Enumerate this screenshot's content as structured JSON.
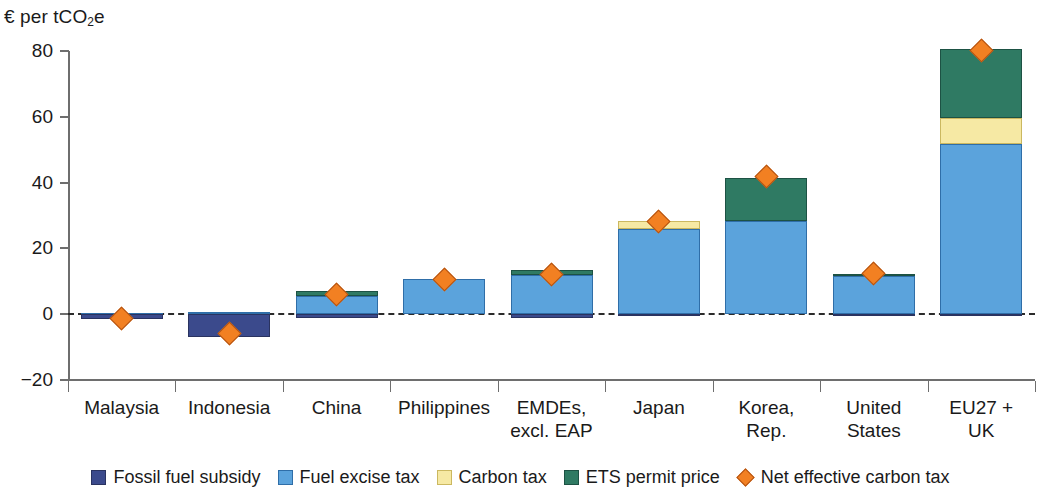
{
  "chart_data": {
    "type": "bar",
    "title": "",
    "subtitle": "",
    "xlabel": "",
    "ylabel": "€ per tCO2e",
    "ylabel_rich": {
      "prefix": "€ per tCO",
      "sub": "2",
      "suffix": "e"
    },
    "ylim": [
      -20,
      80
    ],
    "yticks": [
      -20,
      0,
      20,
      40,
      60,
      80
    ],
    "ytick_labels": [
      "−20",
      "0",
      "20",
      "40",
      "60",
      "80"
    ],
    "grid": false,
    "zero_line": true,
    "stacked": true,
    "legend_position": "bottom",
    "categories": [
      "Malaysia",
      "Indonesia",
      "China",
      "Philippines",
      "EMDEs, excl. EAP",
      "Japan",
      "Korea, Rep.",
      "United States",
      "EU27 + UK"
    ],
    "category_label_lines": [
      [
        "Malaysia",
        ""
      ],
      [
        "Indonesia",
        ""
      ],
      [
        "China",
        ""
      ],
      [
        "Philippines",
        ""
      ],
      [
        "EMDEs,",
        "excl. EAP"
      ],
      [
        "Japan",
        ""
      ],
      [
        "Korea,",
        "Rep."
      ],
      [
        "United",
        "States"
      ],
      [
        "EU27 +",
        "UK"
      ]
    ],
    "series": [
      {
        "name": "Fossil fuel subsidy",
        "color": "#3b4a8c",
        "values": [
          -1.5,
          -7.0,
          -1.2,
          0.0,
          -1.3,
          -0.4,
          0.0,
          -0.3,
          -0.5
        ]
      },
      {
        "name": "Fuel excise tax",
        "color": "#5ba3dc",
        "values": [
          0.3,
          0.8,
          5.5,
          10.6,
          12.0,
          26.0,
          28.2,
          11.6,
          51.6
        ]
      },
      {
        "name": "Carbon tax",
        "color": "#f6e9a4",
        "values": [
          0.0,
          0.0,
          0.0,
          0.0,
          0.0,
          2.3,
          0.0,
          0.0,
          8.0
        ]
      },
      {
        "name": "ETS permit price",
        "color": "#2f7a63",
        "values": [
          0.0,
          0.0,
          1.5,
          0.0,
          1.5,
          0.0,
          13.3,
          0.5,
          21.0
        ]
      }
    ],
    "marker_series": {
      "name": "Net effective carbon tax",
      "color": "#f28022",
      "marker": "diamond",
      "values": [
        -1.4,
        -6.0,
        6.0,
        10.6,
        12.2,
        28.2,
        41.8,
        12.4,
        80.2
      ]
    }
  },
  "legend": {
    "items": [
      {
        "label": "Fossil fuel subsidy",
        "swatch": "subsidy"
      },
      {
        "label": "Fuel excise tax",
        "swatch": "excise"
      },
      {
        "label": "Carbon tax",
        "swatch": "carbontax"
      },
      {
        "label": "ETS permit price",
        "swatch": "ets"
      },
      {
        "label": "Net effective carbon tax",
        "swatch": "diamond-sw"
      }
    ]
  },
  "colors": {
    "subsidy": "#3b4a8c",
    "excise": "#5ba3dc",
    "carbon_tax": "#f6e9a4",
    "ets": "#2f7a63",
    "marker": "#f28022",
    "axis": "#6e6e6e",
    "text": "#1a1a1a"
  }
}
